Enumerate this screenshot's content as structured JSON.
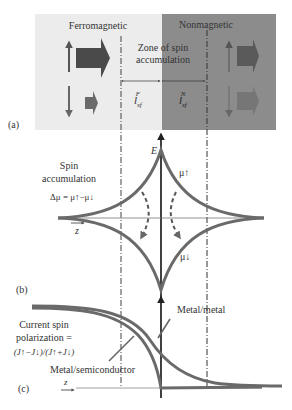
{
  "panel_a": {
    "label": "(a)",
    "left_region_title": "Ferromagnetic",
    "right_region_title": "Nonmagnetic",
    "zone_label_line1": "Zone of spin",
    "zone_label_line2": "accumulation",
    "lsf_f_main": "l",
    "lsf_f_sub": "sf",
    "lsf_f_sup": "F",
    "lsf_n_main": "l",
    "lsf_n_sub": "sf",
    "lsf_n_sup": "N",
    "colors": {
      "ferro_bg": "#ececec",
      "nonmag_bg": "#8a8a8a",
      "arrow_dark": "#4a4a4a",
      "arrow_mid": "#6a6a6a"
    }
  },
  "panel_b": {
    "label": "(b)",
    "axis_label": "E",
    "title_line1": "Spin",
    "title_line2": "accumulation",
    "formula": "Δμ = μ↑−μ↓",
    "mu_up": "μ↑",
    "mu_down": "μ↓",
    "z_label": "z"
  },
  "panel_c": {
    "label": "(c)",
    "ylabel_line1": "Current spin",
    "ylabel_line2": "polarization =",
    "ylabel_line3": "(J↑−J↓)/(J↑+J↓)",
    "curve1_label": "Metal/metal",
    "curve2_label": "Metal/semiconductor",
    "z_label": "z"
  }
}
